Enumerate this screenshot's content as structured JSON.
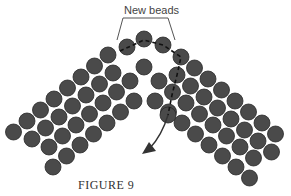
{
  "figure": {
    "caption": "FIGURE 9",
    "callout_label": "New beads",
    "colors": {
      "bead": "#4a4a4a",
      "bead_edge": "#2a2a2a",
      "thread": "#111111",
      "bracket": "#555555"
    }
  },
  "beads": {
    "new": [
      [
        127,
        47
      ],
      [
        144,
        39
      ],
      [
        163,
        45
      ]
    ],
    "apex_extra": [
      [
        108,
        55
      ],
      [
        181,
        57
      ]
    ],
    "center": [
      [
        144,
        67
      ],
      [
        130,
        81
      ],
      [
        159,
        81
      ],
      [
        134,
        101
      ],
      [
        155,
        101
      ],
      [
        168,
        115
      ]
    ],
    "left_rows": [
      {
        "start": [
          108,
          55
        ],
        "count": 8
      },
      {
        "start": [
          113,
          73
        ],
        "count": 7
      },
      {
        "start": [
          130,
          81
        ],
        "count": 7
      },
      {
        "start": [
          134,
          101
        ],
        "count": 7
      }
    ],
    "right_rows": [
      {
        "start": [
          181,
          57
        ],
        "count": 8
      },
      {
        "start": [
          177,
          75
        ],
        "count": 8
      },
      {
        "start": [
          159,
          81
        ],
        "count": 8
      },
      {
        "start": [
          155,
          101
        ],
        "count": 8
      }
    ]
  }
}
